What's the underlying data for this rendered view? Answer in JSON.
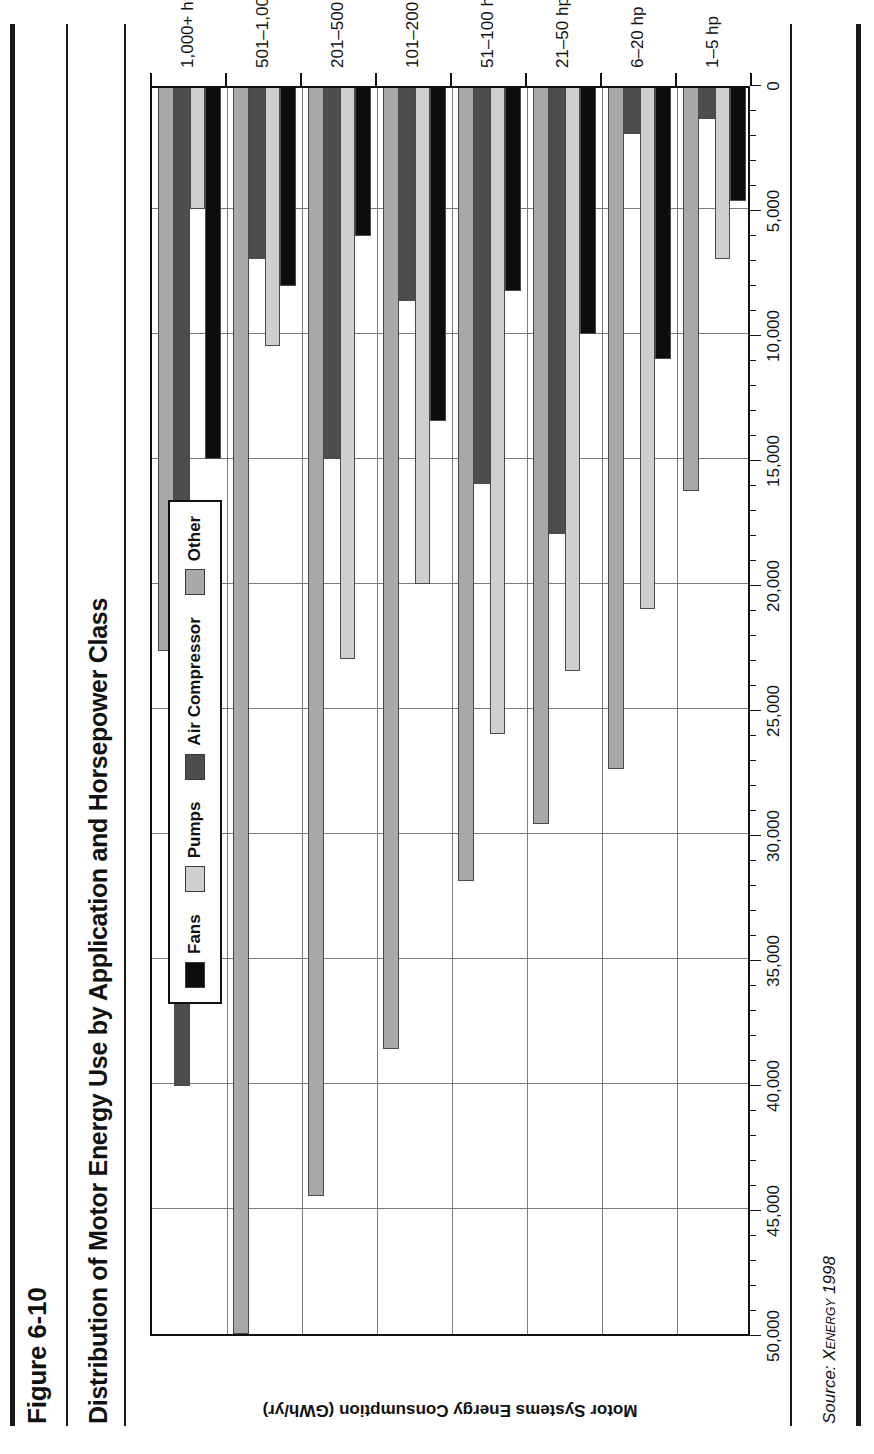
{
  "figure": {
    "label": "Figure 6-10",
    "title": "Distribution of Motor Energy Use by Application and Horsepower Class",
    "source_prefix": "Source:",
    "source_name": "Xenergy",
    "source_year": "1998"
  },
  "chart_data": {
    "type": "bar",
    "orientation": "horizontal",
    "title": "Distribution of Motor Energy Use by Application and Horsepower Class",
    "xlabel": "",
    "ylabel": "Motor Systems Energy Consumption (GWh/yr)",
    "ylim": [
      0,
      50000
    ],
    "ytick_labels": [
      "0",
      "5,000",
      "10,000",
      "15,000",
      "20,000",
      "25,000",
      "30,000",
      "35,000",
      "40,000",
      "45,000",
      "50,000"
    ],
    "ytick_values": [
      0,
      5000,
      10000,
      15000,
      20000,
      25000,
      30000,
      35000,
      40000,
      45000,
      50000
    ],
    "minor_tick_step": 1000,
    "grid": true,
    "legend_position": "top-left-inside",
    "categories": [
      "1–5 hp",
      "6–20 hp",
      "21–50 hp",
      "51–100 hp",
      "101–200 hp",
      "201–500 hp",
      "501–1,000 hp",
      "1,000+ hp"
    ],
    "series": [
      {
        "name": "Fans",
        "color": "#0d0d0d",
        "values": [
          4700,
          11000,
          10000,
          8300,
          13500,
          6100,
          8100,
          15000
        ]
      },
      {
        "name": "Pumps",
        "color": "#cfcfcf",
        "values": [
          7000,
          21000,
          23500,
          26000,
          20000,
          23000,
          10500,
          5000
        ]
      },
      {
        "name": "Air Compressor",
        "color": "#4d4d4d",
        "values": [
          1400,
          2000,
          18000,
          16000,
          8700,
          15000,
          7000,
          40100
        ]
      },
      {
        "name": "Other",
        "color": "#a8a8a8",
        "values": [
          16300,
          27400,
          29600,
          31900,
          38600,
          44500,
          50000,
          22700
        ]
      }
    ]
  },
  "legend": {
    "items": [
      {
        "label": "Fans",
        "color": "#0d0d0d"
      },
      {
        "label": "Pumps",
        "color": "#cfcfcf"
      },
      {
        "label": "Air Compressor",
        "color": "#4d4d4d"
      },
      {
        "label": "Other",
        "color": "#a8a8a8"
      }
    ]
  }
}
